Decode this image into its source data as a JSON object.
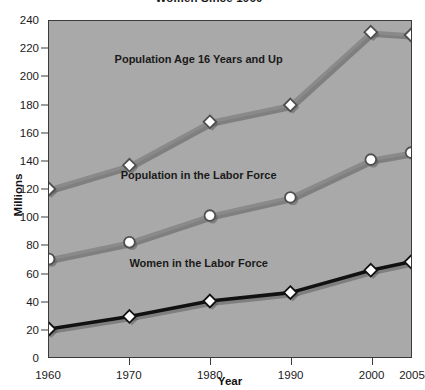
{
  "chart_data": {
    "type": "line",
    "title": "Women Since 1960",
    "xlabel": "Year",
    "ylabel": "Millions",
    "categories": [
      "1960",
      "1970",
      "1980",
      "1990",
      "2000",
      "2005"
    ],
    "x": [
      1960,
      1970,
      1980,
      1990,
      2000,
      2005
    ],
    "xlim": [
      1960,
      2005
    ],
    "ylim": [
      0,
      240
    ],
    "y_ticks": [
      0,
      20,
      40,
      60,
      80,
      100,
      120,
      140,
      160,
      180,
      200,
      220,
      240
    ],
    "x_ticks": [
      "1960",
      "1970",
      "1980",
      "1990",
      "2000",
      "2005"
    ],
    "grid": false,
    "legend": "inline-annotations",
    "series": [
      {
        "name": "Population Age 16 Years and Up",
        "values": [
          120,
          137,
          168,
          180,
          232,
          230
        ],
        "color": "#8a8a8a",
        "marker": "diamond",
        "annotation_x": 1978.5,
        "annotation_y": 213
      },
      {
        "name": "Population in the Labor Force",
        "values": [
          70,
          82,
          101,
          114,
          141,
          146
        ],
        "color": "#8a8a8a",
        "marker": "circle",
        "annotation_x": 1978.5,
        "annotation_y": 131
      },
      {
        "name": "Women in the Labor Force",
        "values": [
          20,
          29,
          40,
          46,
          62,
          68
        ],
        "color": "#111111",
        "marker": "diamond",
        "annotation_x": 1978.5,
        "annotation_y": 68
      }
    ],
    "colors": {
      "plot_background": "#a9a9a9",
      "page_background": "#ffffff",
      "axis": "#3a3a3a",
      "text": "#1a1a1a",
      "series_gray": "#8a8a8a",
      "series_black": "#111111",
      "marker_fill": "#ffffff"
    }
  }
}
